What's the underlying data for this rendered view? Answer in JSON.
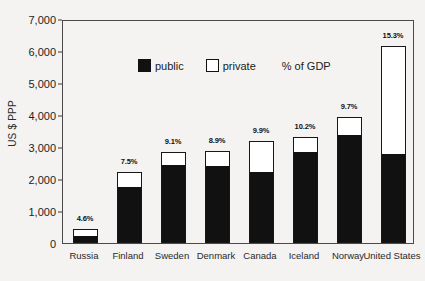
{
  "chart_data": {
    "type": "bar",
    "subtype": "stacked-vertical",
    "title": "",
    "subtitle": "",
    "xlabel": "",
    "ylabel": "US $ PPP",
    "ylim": [
      0,
      7000
    ],
    "ytick_values": [
      0,
      1000,
      2000,
      3000,
      4000,
      5000,
      6000,
      7000
    ],
    "ytick_labels": [
      "0",
      "1,000",
      "2,000",
      "3,000",
      "4,000",
      "5,000",
      "6,000",
      "7,000"
    ],
    "grid": false,
    "legend_position": "inside-top-left",
    "categories": [
      "Russia",
      "Finland",
      "Sweden",
      "Denmark",
      "Canada",
      "Iceland",
      "Norway",
      "United States"
    ],
    "series": [
      {
        "name": "public",
        "color": "#111111",
        "values": [
          200,
          1710,
          2420,
          2380,
          2200,
          2800,
          3350,
          2750
        ]
      },
      {
        "name": "private",
        "color": "#ffffff",
        "values": [
          250,
          520,
          410,
          490,
          1000,
          500,
          600,
          3400
        ]
      }
    ],
    "totals": [
      450,
      2230,
      2830,
      2870,
      3200,
      3300,
      3950,
      6150
    ],
    "annotations": {
      "label": "% of GDP",
      "values": [
        "4.6%",
        "7.5%",
        "9.1%",
        "8.9%",
        "9.9%",
        "10.2%",
        "9.7%",
        "15.3%"
      ]
    }
  },
  "legend": {
    "public_label": "public",
    "private_label": "private",
    "note": "% of GDP"
  },
  "colors": {
    "public": "#111111",
    "private": "#ffffff",
    "outline": "#171717",
    "background": "#f4f3f1",
    "axis": "#4a4a4a"
  }
}
